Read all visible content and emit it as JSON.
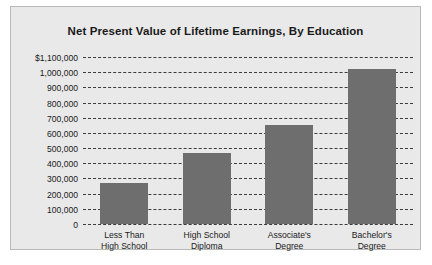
{
  "chart_data": {
    "type": "bar",
    "title": "Net Present Value of Lifetime Earnings, By Education",
    "xlabel": "",
    "ylabel": "",
    "categories": [
      "Less Than\nHigh School",
      "High School\nDiploma",
      "Associate's\nDegree",
      "Bachelor's\nDegree"
    ],
    "category_lines": [
      [
        "Less Than",
        "High School"
      ],
      [
        "High School",
        "Diploma"
      ],
      [
        "Associate's",
        "Degree"
      ],
      [
        "Bachelor's",
        "Degree"
      ]
    ],
    "values": [
      270000,
      470000,
      650000,
      1020000
    ],
    "ylim": [
      0,
      1100000
    ],
    "ytick_values": [
      1100000,
      1000000,
      900000,
      800000,
      700000,
      600000,
      500000,
      400000,
      300000,
      200000,
      100000,
      0
    ],
    "ytick_labels": [
      "$1,100,000",
      "1,000,000",
      "900,000",
      "800,000",
      "700,000",
      "600,000",
      "500,000",
      "400,000",
      "300,000",
      "200,000",
      "100,000",
      "0"
    ],
    "grid": true,
    "grid_style": "dashed",
    "legend": false,
    "bar_color": "#6e6e6e",
    "panel_color": "#e9e9e9",
    "grid_color": "#3a3a3a",
    "text_color": "#1a1a1a"
  }
}
